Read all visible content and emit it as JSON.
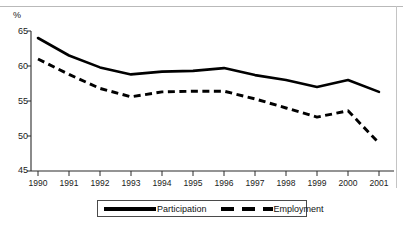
{
  "figure": {
    "y_axis_unit_label": "%",
    "border_color": "#000000"
  },
  "legend": {
    "participation_label": "Participation",
    "employment_label": "Employment"
  },
  "axis": {
    "y_ticks": [
      "65",
      "60",
      "55",
      "50",
      "45"
    ],
    "x_ticks": [
      "1990",
      "1991",
      "1992",
      "1993",
      "1994",
      "1995",
      "1996",
      "1997",
      "1998",
      "1999",
      "2000",
      "2001"
    ]
  },
  "chart_data": {
    "type": "line",
    "title": "",
    "subtitle": "",
    "xlabel": "",
    "ylabel": "%",
    "ylim": [
      45,
      65
    ],
    "ytick_values": [
      45,
      50,
      55,
      60,
      65
    ],
    "grid": false,
    "legend_position": "bottom-center",
    "categories": [
      "1990",
      "1991",
      "1992",
      "1993",
      "1994",
      "1995",
      "1996",
      "1997",
      "1998",
      "1999",
      "2000",
      "2001"
    ],
    "x": [
      1990,
      1991,
      1992,
      1993,
      1994,
      1995,
      1996,
      1997,
      1998,
      1999,
      2000,
      2001
    ],
    "series": [
      {
        "name": "Participation",
        "style": "solid",
        "color": "#000000",
        "values": [
          64.0,
          61.5,
          59.8,
          58.8,
          59.2,
          59.3,
          59.7,
          58.7,
          58.0,
          57.0,
          58.0,
          56.3
        ]
      },
      {
        "name": "Employment",
        "style": "dashed",
        "color": "#000000",
        "values": [
          61.0,
          58.8,
          56.8,
          55.6,
          56.3,
          56.4,
          56.4,
          55.3,
          54.0,
          52.7,
          53.6,
          49.0
        ]
      }
    ]
  }
}
